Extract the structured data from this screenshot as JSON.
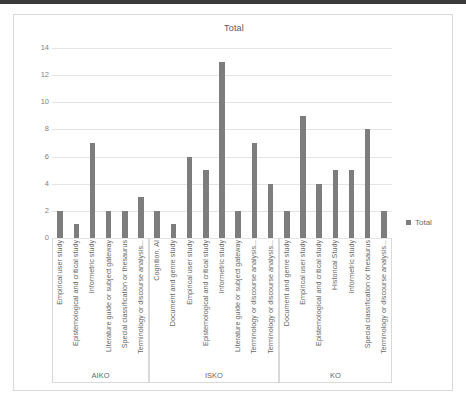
{
  "chart_data": {
    "type": "bar",
    "title": "Total",
    "xlabel": "",
    "ylabel": "",
    "ylim": [
      0,
      14
    ],
    "yticks": [
      0,
      2,
      4,
      6,
      8,
      10,
      12,
      14
    ],
    "grid": true,
    "legend_position": "right",
    "series": [
      {
        "name": "Total",
        "color": "#7d7d7d",
        "values": [
          2,
          1,
          7,
          2,
          2,
          3,
          2,
          1,
          6,
          5,
          13,
          2,
          7,
          4,
          2,
          9,
          4,
          5,
          5,
          8,
          2
        ]
      }
    ],
    "categories": [
      "Empirical user study",
      "Epistemological and critical study",
      "Informetric study",
      "Literature guide or subject gateway",
      "Special classification or thesaurus",
      "Terminology or discourse analysis...",
      "Cognition, AI",
      "Document and genre study",
      "Empirical user study",
      "Epistemological and critical study",
      "Informetric study",
      "Literature guide or subject gateway",
      "Terminology or discourse analysis...",
      "Terminology or discourse analysis...",
      "Document and genre study",
      "Empirical user study",
      "Epistemological and critical study",
      "Historical Study",
      "Informetric study",
      "Special classification or thesaurus",
      "Terminology or discourse analysis..."
    ],
    "groups": [
      {
        "name": "AIKO",
        "start": 0,
        "count": 6
      },
      {
        "name": "ISKO",
        "start": 6,
        "count": 8
      },
      {
        "name": "KO",
        "start": 14,
        "count": 7
      }
    ]
  },
  "legend": {
    "label": "Total"
  },
  "colors": {
    "bar": "#7d7d7d",
    "grid": "#e4e4e4",
    "frame": "#d9d9d9",
    "text": "#676767"
  }
}
